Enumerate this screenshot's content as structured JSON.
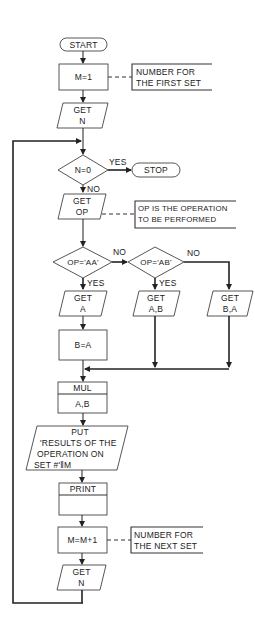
{
  "flowchart": {
    "start": "START",
    "init": "M=1",
    "init_note": [
      "NUMBER FOR",
      "THE FIRST SET"
    ],
    "get_n_1": [
      "GET",
      "N"
    ],
    "test_n": "N=0",
    "test_n_yes": "YES",
    "test_n_no": "NO",
    "stop": "STOP",
    "get_op": [
      "GET",
      "OP"
    ],
    "get_op_note": [
      "OP IS THE OPERATION",
      "TO BE PERFORMED"
    ],
    "test_aa": "OP='AA'",
    "test_aa_no": "NO",
    "test_aa_yes": "YES",
    "test_ab": "OP='AB'",
    "test_ab_no": "NO",
    "test_ab_yes": "YES",
    "get_a": [
      "GET",
      "A"
    ],
    "get_ab": [
      "GET",
      "A,B"
    ],
    "get_ba": [
      "GET",
      "B,A"
    ],
    "assign_b": "B=A",
    "mul": [
      "MUL",
      "A,B"
    ],
    "put": [
      "PUT",
      "'RESULTS OF THE",
      "OPERATION ON",
      "SET #'‖M"
    ],
    "print": "PRINT",
    "increment": "M=M+1",
    "increment_note": [
      "NUMBER FOR",
      "THE NEXT SET"
    ],
    "get_n_2": [
      "GET",
      "N"
    ]
  },
  "colors": {
    "line": "#333333",
    "background": "#ffffff",
    "text": "#222222"
  }
}
